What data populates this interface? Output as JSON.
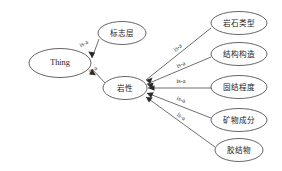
{
  "diagram": {
    "type": "ontology-graph",
    "background_color": "#ffffff",
    "node_stroke_color": "#4a4a4a",
    "node_fill_color": "#ffffff",
    "edge_color": "#4a4a4a",
    "arrow_color": "#2b2b2b",
    "label_color": "#1a1a1a",
    "nodes": [
      {
        "id": "thing",
        "label": "Thing",
        "cx": 60,
        "cy": 63,
        "rx": 31,
        "ry": 14.5,
        "script": "latin"
      },
      {
        "id": "marker",
        "label": "标志层",
        "cx": 122,
        "cy": 33,
        "rx": 24,
        "ry": 11.5,
        "script": "cjk"
      },
      {
        "id": "lithology",
        "label": "岩性",
        "cx": 125,
        "cy": 88,
        "rx": 22,
        "ry": 11.5,
        "script": "cjk"
      },
      {
        "id": "rocktype",
        "label": "岩石类型",
        "cx": 239,
        "cy": 23,
        "rx": 28,
        "ry": 11.5,
        "script": "cjk"
      },
      {
        "id": "structure",
        "label": "结构构造",
        "cx": 239,
        "cy": 54,
        "rx": 28,
        "ry": 11.5,
        "script": "cjk"
      },
      {
        "id": "consol",
        "label": "固结程度",
        "cx": 239,
        "cy": 87,
        "rx": 28,
        "ry": 11.5,
        "script": "cjk"
      },
      {
        "id": "mineral",
        "label": "矿物成分",
        "cx": 239,
        "cy": 120,
        "rx": 28,
        "ry": 11.5,
        "script": "cjk"
      },
      {
        "id": "cement",
        "label": "胶结物",
        "cx": 239,
        "cy": 150,
        "rx": 24,
        "ry": 11.5,
        "script": "cjk"
      }
    ],
    "edges": [
      {
        "id": "e-marker-thing",
        "from": "marker",
        "to": "thing",
        "label": "is-a",
        "x1": 99,
        "y1": 39,
        "x2": 92,
        "y2": 58,
        "lx": 84,
        "ly": 44,
        "rot": -28
      },
      {
        "id": "e-lith-thing",
        "from": "lithology",
        "to": "thing",
        "label": "is-a",
        "x1": 106,
        "y1": 84,
        "x2": 92,
        "y2": 69,
        "lx": 93,
        "ly": 70,
        "rot": -28
      },
      {
        "id": "e-rocktype-lith",
        "from": "rocktype",
        "to": "lithology",
        "label": "is-a",
        "x1": 211,
        "y1": 28,
        "x2": 146,
        "y2": 80,
        "lx": 178,
        "ly": 48,
        "rot": -39
      },
      {
        "id": "e-structure-lith",
        "from": "structure",
        "to": "lithology",
        "label": "is-a",
        "x1": 211,
        "y1": 57,
        "x2": 147,
        "y2": 84,
        "lx": 181,
        "ly": 65,
        "rot": -23
      },
      {
        "id": "e-consol-lith",
        "from": "consol",
        "to": "lithology",
        "label": "is-a",
        "x1": 211,
        "y1": 88,
        "x2": 148,
        "y2": 88,
        "lx": 181,
        "ly": 82,
        "rot": 0
      },
      {
        "id": "e-mineral-lith",
        "from": "mineral",
        "to": "lithology",
        "label": "is-a",
        "x1": 211,
        "y1": 118,
        "x2": 147,
        "y2": 93,
        "lx": 181,
        "ly": 100,
        "rot": 21
      },
      {
        "id": "e-cement-lith",
        "from": "cement",
        "to": "lithology",
        "label": "is-a",
        "x1": 215,
        "y1": 147,
        "x2": 146,
        "y2": 97,
        "lx": 181,
        "ly": 117,
        "rot": 35
      }
    ]
  }
}
